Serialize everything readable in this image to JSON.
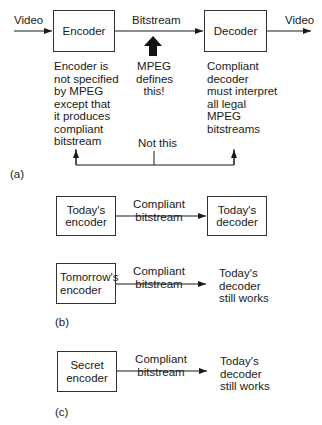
{
  "part_a": {
    "label": "(a)",
    "input_label": "Video",
    "output_label": "Video",
    "encoder_box": "Encoder",
    "decoder_box": "Decoder",
    "bitstream_label": "Bitstream",
    "mpeg_note": [
      "MPEG",
      "defines",
      "this!"
    ],
    "encoder_note": [
      "Encoder is",
      "not specified",
      "by MPEG",
      "except that",
      "it produces",
      "compliant",
      "bitstream"
    ],
    "decoder_note": [
      "Compliant",
      "decoder",
      "must interpret",
      "all legal",
      "MPEG",
      "bitstreams"
    ],
    "not_this_label": "Not this"
  },
  "part_b": {
    "label": "(b)",
    "row1": {
      "encoder_box": [
        "Today's",
        "encoder"
      ],
      "link_label": [
        "Compliant",
        "bitstream"
      ],
      "decoder_box": [
        "Today's",
        "decoder"
      ]
    },
    "row2": {
      "encoder_box": [
        "Tomorrow's",
        "encoder"
      ],
      "link_label": [
        "Compliant",
        "bitstream"
      ],
      "result": [
        "Today's",
        "decoder",
        "still works"
      ]
    }
  },
  "part_c": {
    "label": "(c)",
    "encoder_box": [
      "Secret",
      "encoder"
    ],
    "link_label": [
      "Compliant",
      "bitstream"
    ],
    "result": [
      "Today's",
      "decoder",
      "still works"
    ]
  }
}
